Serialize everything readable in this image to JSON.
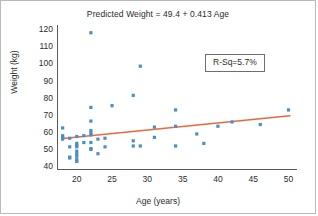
{
  "chart_data": {
    "type": "scatter",
    "title": "Predicted Weight = 49.4 + 0.413 Age",
    "xlabel": "Age (years)",
    "ylabel": "Weight (kg)",
    "xlim": [
      17.2,
      51.2
    ],
    "ylim": [
      38.5,
      123.0
    ],
    "xticks": [
      20,
      25,
      30,
      35,
      40,
      45,
      50
    ],
    "yticks": [
      40,
      50,
      60,
      70,
      80,
      90,
      100,
      110,
      120
    ],
    "grid": false,
    "legend": null,
    "marker_color": "#4a8fc4",
    "line_color": "#e8683c",
    "axis_color": "#5a5a5a",
    "annotations": [
      {
        "name": "r-squared",
        "text": "R-Sq=5.7%",
        "x": 43.0,
        "y": 99.0
      }
    ],
    "fit_line": {
      "name": "regression-line",
      "equation": "Predicted Weight = 49.4 + 0.413 Age",
      "intercept": 49.4,
      "slope": 0.413,
      "x_start": 18.0,
      "x_end": 50.2
    },
    "points": [
      {
        "x": 18.0,
        "y": 63.0
      },
      {
        "x": 18.0,
        "y": 58.5
      },
      {
        "x": 18.0,
        "y": 57.5
      },
      {
        "x": 18.0,
        "y": 56.5
      },
      {
        "x": 19.0,
        "y": 57.0
      },
      {
        "x": 19.0,
        "y": 52.0
      },
      {
        "x": 19.0,
        "y": 46.0
      },
      {
        "x": 19.0,
        "y": 45.5
      },
      {
        "x": 20.0,
        "y": 58.0
      },
      {
        "x": 20.0,
        "y": 54.0
      },
      {
        "x": 20.0,
        "y": 53.0
      },
      {
        "x": 20.0,
        "y": 52.0
      },
      {
        "x": 20.0,
        "y": 49.5
      },
      {
        "x": 20.0,
        "y": 48.0
      },
      {
        "x": 20.0,
        "y": 46.5
      },
      {
        "x": 20.0,
        "y": 44.5
      },
      {
        "x": 20.0,
        "y": 43.5
      },
      {
        "x": 21.0,
        "y": 58.5
      },
      {
        "x": 21.0,
        "y": 54.5
      },
      {
        "x": 22.0,
        "y": 118.5
      },
      {
        "x": 22.0,
        "y": 75.0
      },
      {
        "x": 22.0,
        "y": 67.0
      },
      {
        "x": 22.0,
        "y": 61.5
      },
      {
        "x": 22.0,
        "y": 60.0
      },
      {
        "x": 22.0,
        "y": 59.0
      },
      {
        "x": 22.0,
        "y": 54.5
      },
      {
        "x": 22.0,
        "y": 51.0
      },
      {
        "x": 22.0,
        "y": 50.5
      },
      {
        "x": 23.0,
        "y": 56.5
      },
      {
        "x": 23.0,
        "y": 48.0
      },
      {
        "x": 24.0,
        "y": 57.0
      },
      {
        "x": 24.0,
        "y": 52.0
      },
      {
        "x": 25.0,
        "y": 76.0
      },
      {
        "x": 28.0,
        "y": 82.0
      },
      {
        "x": 28.0,
        "y": 55.5
      },
      {
        "x": 28.0,
        "y": 52.5
      },
      {
        "x": 29.0,
        "y": 99.0
      },
      {
        "x": 29.0,
        "y": 52.5
      },
      {
        "x": 31.0,
        "y": 63.5
      },
      {
        "x": 31.0,
        "y": 57.5
      },
      {
        "x": 34.0,
        "y": 73.5
      },
      {
        "x": 34.0,
        "y": 64.0
      },
      {
        "x": 34.0,
        "y": 52.5
      },
      {
        "x": 37.0,
        "y": 59.5
      },
      {
        "x": 38.0,
        "y": 54.0
      },
      {
        "x": 40.0,
        "y": 64.0
      },
      {
        "x": 42.0,
        "y": 66.5
      },
      {
        "x": 46.0,
        "y": 65.0
      },
      {
        "x": 50.0,
        "y": 73.5
      }
    ]
  }
}
